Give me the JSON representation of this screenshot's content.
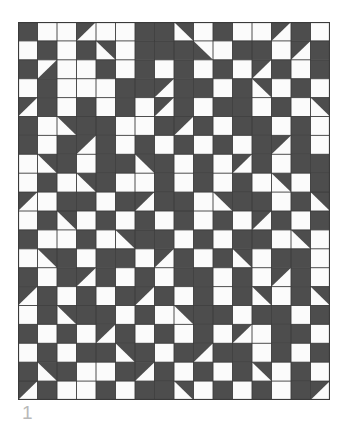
{
  "figure": {
    "caption": "1",
    "type": "quilt-pattern",
    "background_color": "#ffffff",
    "caption_color": "#b9b9b9"
  },
  "grid": {
    "columns": 16,
    "rows": 20,
    "cell_width": 19.5,
    "cell_height": 18.9,
    "origin_x": 18,
    "origin_y": 22,
    "width": 312,
    "height": 378,
    "dark_color": "#4d4d4d",
    "light_color": "#fbfbfb",
    "line_color": "#3a3a3a",
    "line_width": 0.9,
    "border_color": "#3a3a3a",
    "border_width": 1.2
  },
  "legend": {
    "cell_types": [
      {
        "code": "D",
        "name": "dark-full",
        "description": "solid dark square"
      },
      {
        "code": "L",
        "name": "light-full",
        "description": "solid light square"
      },
      {
        "code": "TL",
        "name": "triangle-top-left",
        "description": "dark triangle in top-left half"
      },
      {
        "code": "TR",
        "name": "triangle-top-right",
        "description": "dark triangle in top-right half"
      },
      {
        "code": "BL",
        "name": "triangle-bottom-left",
        "description": "dark triangle in bottom-left half"
      },
      {
        "code": "BR",
        "name": "triangle-bottom-right",
        "description": "dark triangle in bottom-right half"
      }
    ]
  },
  "chart_data": {
    "type": "heatmap",
    "xlabel": "",
    "ylabel": "",
    "columns": 16,
    "rows": 20,
    "cells": [
      [
        "D",
        "L",
        "L",
        "TL",
        "L",
        "L",
        "D",
        "D",
        "TR",
        "L",
        "D",
        "L",
        "L",
        "TL",
        "D",
        "L"
      ],
      [
        "L",
        "D",
        "L",
        "D",
        "TR",
        "L",
        "D",
        "D",
        "D",
        "BL",
        "L",
        "D",
        "D",
        "L",
        "TL",
        "D"
      ],
      [
        "D",
        "BR",
        "L",
        "L",
        "D",
        "L",
        "D",
        "L",
        "D",
        "L",
        "D",
        "L",
        "TL",
        "D",
        "L",
        "D"
      ],
      [
        "L",
        "D",
        "L",
        "L",
        "L",
        "D",
        "D",
        "TL",
        "D",
        "D",
        "L",
        "D",
        "TR",
        "L",
        "D",
        "L"
      ],
      [
        "TL",
        "D",
        "L",
        "D",
        "L",
        "D",
        "L",
        "TL",
        "D",
        "L",
        "D",
        "D",
        "L",
        "D",
        "L",
        "TR"
      ],
      [
        "D",
        "L",
        "TR",
        "D",
        "D",
        "L",
        "L",
        "D",
        "TL",
        "D",
        "L",
        "D",
        "D",
        "L",
        "D",
        "L"
      ],
      [
        "D",
        "L",
        "D",
        "TL",
        "D",
        "L",
        "D",
        "L",
        "D",
        "L",
        "D",
        "L",
        "D",
        "TL",
        "D",
        "L"
      ],
      [
        "L",
        "TR",
        "D",
        "L",
        "D",
        "D",
        "TR",
        "D",
        "L",
        "D",
        "L",
        "TL",
        "D",
        "L",
        "D",
        "D"
      ],
      [
        "L",
        "D",
        "L",
        "TR",
        "D",
        "L",
        "L",
        "D",
        "L",
        "D",
        "L",
        "D",
        "L",
        "TR",
        "L",
        "D"
      ],
      [
        "TL",
        "L",
        "D",
        "D",
        "L",
        "D",
        "TL",
        "D",
        "D",
        "L",
        "TR",
        "D",
        "D",
        "L",
        "D",
        "TR"
      ],
      [
        "L",
        "D",
        "TR",
        "L",
        "D",
        "L",
        "D",
        "L",
        "D",
        "L",
        "D",
        "L",
        "TL",
        "D",
        "L",
        "D"
      ],
      [
        "D",
        "L",
        "L",
        "D",
        "L",
        "TR",
        "D",
        "D",
        "L",
        "D",
        "L",
        "D",
        "D",
        "L",
        "TR",
        "L"
      ],
      [
        "L",
        "TR",
        "D",
        "L",
        "D",
        "D",
        "L",
        "TL",
        "D",
        "L",
        "D",
        "TR",
        "L",
        "D",
        "D",
        "L"
      ],
      [
        "D",
        "L",
        "D",
        "TL",
        "D",
        "L",
        "D",
        "L",
        "D",
        "D",
        "L",
        "D",
        "L",
        "TL",
        "D",
        "L"
      ],
      [
        "TL",
        "D",
        "L",
        "D",
        "L",
        "D",
        "TL",
        "D",
        "L",
        "D",
        "L",
        "D",
        "TR",
        "L",
        "D",
        "TR"
      ],
      [
        "L",
        "D",
        "TR",
        "D",
        "D",
        "L",
        "D",
        "L",
        "TR",
        "D",
        "D",
        "L",
        "D",
        "D",
        "L",
        "D"
      ],
      [
        "D",
        "L",
        "D",
        "L",
        "TL",
        "D",
        "L",
        "D",
        "L",
        "D",
        "L",
        "TL",
        "L",
        "D",
        "D",
        "L"
      ],
      [
        "L",
        "D",
        "L",
        "D",
        "D",
        "TR",
        "D",
        "L",
        "D",
        "TL",
        "D",
        "D",
        "L",
        "D",
        "L",
        "D"
      ],
      [
        "D",
        "TR",
        "D",
        "L",
        "L",
        "D",
        "TL",
        "D",
        "L",
        "D",
        "L",
        "D",
        "TR",
        "L",
        "D",
        "L"
      ],
      [
        "TL",
        "D",
        "L",
        "L",
        "D",
        "L",
        "D",
        "D",
        "TR",
        "L",
        "D",
        "L",
        "D",
        "L",
        "D",
        "TL"
      ]
    ]
  }
}
